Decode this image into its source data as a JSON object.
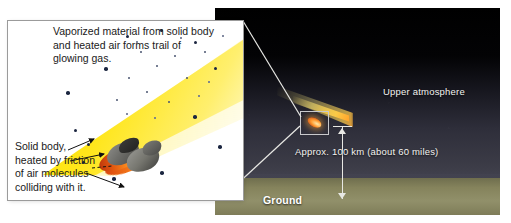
{
  "diagram": {
    "inset_panel": {
      "name": "magnified-view",
      "annotations": {
        "vaporized": "Vaporized material from solid body\nand heated air forms trail of\nglowing gas.",
        "solid_body": "Solid body,\nheated by friction\nof air molecules\ncolliding with it."
      }
    },
    "scene": {
      "labels": {
        "upper_atmosphere": "Upper atmosphere",
        "ground": "Ground",
        "distance": "Approx. 100 km\n(about 60 miles)"
      }
    },
    "colors": {
      "plume_yellow": "#ffe400",
      "heat_orange": "#e2560f",
      "rock_grey": "#6d6d69",
      "sky_top": "#000000",
      "sky_bottom": "#434350",
      "ground_olive": "#85835c",
      "leader_line": "#e8e8e4",
      "panel_border": "#9b9b9b"
    }
  }
}
